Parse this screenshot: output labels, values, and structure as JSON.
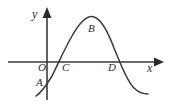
{
  "figure": {
    "background_color": "#ffffff",
    "stroke_color": "#3a3a3a",
    "label_color": "#2b2b2b"
  },
  "axes": {
    "x_label": "x",
    "y_label": "y",
    "origin_label": "O",
    "x_axis": {
      "from_px": [
        8,
        62
      ],
      "to_px": [
        162,
        62
      ],
      "arrow": "right"
    },
    "y_axis": {
      "from_px": [
        47,
        100
      ],
      "to_px": [
        47,
        8
      ],
      "arrow": "up"
    }
  },
  "points": [
    {
      "id": "A",
      "label": "A",
      "role": "y-intercept-below-axis",
      "approx_px": [
        47,
        88
      ]
    },
    {
      "id": "B",
      "label": "B",
      "role": "local-maximum",
      "approx_px": [
        93,
        18
      ]
    },
    {
      "id": "C",
      "label": "C",
      "role": "x-intercept-rising",
      "approx_px": [
        60,
        62
      ]
    },
    {
      "id": "D",
      "label": "D",
      "role": "x-intercept-falling",
      "approx_px": [
        120,
        62
      ]
    }
  ],
  "chart_data": {
    "type": "line",
    "title": "",
    "xlabel": "x",
    "ylabel": "y",
    "grid": false,
    "legend": null,
    "annotations": [
      "A",
      "B",
      "C",
      "D",
      "O"
    ],
    "curve_path": "M 36 96 C 42 92, 46 86, 52 76 C 58 64, 64 50, 72 36 C 80 22, 88 15, 94 17 C 101 19, 108 32, 114 48 C 120 62, 126 80, 134 88 C 139 93, 144 94, 148 94",
    "x_axis_line": "M 8 62 L 156 62",
    "y_axis_line": "M 47 100 L 47 14"
  }
}
